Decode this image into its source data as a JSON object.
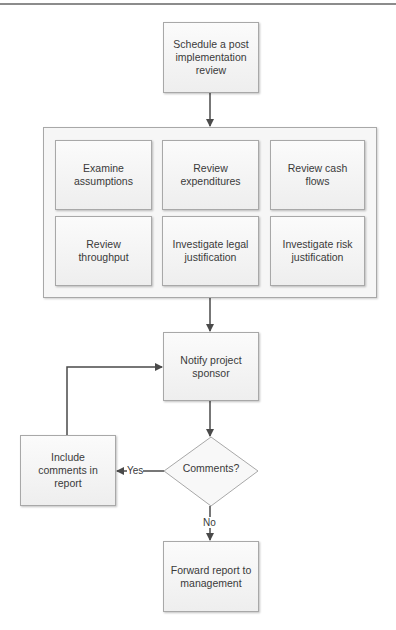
{
  "flowchart": {
    "start": {
      "label": "Schedule a post implementation review"
    },
    "review_group": {
      "items": [
        {
          "label": "Examine assumptions"
        },
        {
          "label": "Review expenditures"
        },
        {
          "label": "Review cash flows"
        },
        {
          "label": "Review throughput"
        },
        {
          "label": "Investigate legal justification"
        },
        {
          "label": "Investigate risk justification"
        }
      ]
    },
    "notify": {
      "label": "Notify project sponsor"
    },
    "decision": {
      "label": "Comments?"
    },
    "include": {
      "label": "Include comments in report"
    },
    "forward": {
      "label": "Forward report to management"
    },
    "edges": {
      "yes_label": "Yes",
      "no_label": "No"
    }
  },
  "colors": {
    "line": "#4a4a4a",
    "box_border": "#a8a8a8",
    "box_fill": "#f2f2f2",
    "text": "#3a3a3a"
  }
}
